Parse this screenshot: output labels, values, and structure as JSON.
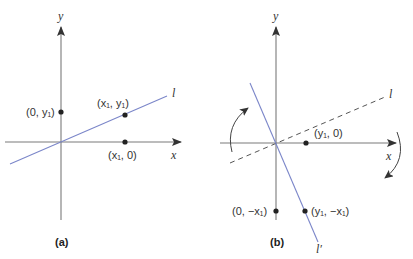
{
  "figure": {
    "panel_a": {
      "caption": "(a)",
      "axis_x_label": "x",
      "axis_y_label": "y",
      "line_label": "l",
      "points": [
        {
          "label": "(0, y₁)",
          "name": "point-0-y1"
        },
        {
          "label": "(x₁, y₁)",
          "name": "point-x1-y1"
        },
        {
          "label": "(x₁, 0)",
          "name": "point-x1-0"
        }
      ]
    },
    "panel_b": {
      "caption": "(b)",
      "axis_x_label": "x",
      "axis_y_label": "y",
      "original_line_label": "l",
      "rotated_line_label": "l′",
      "points": [
        {
          "label": "(y₁, 0)",
          "name": "point-y1-0"
        },
        {
          "label": "(0, −x₁)",
          "name": "point-0-negx1"
        },
        {
          "label": "(y₁, −x₁)",
          "name": "point-y1-negx1"
        }
      ],
      "rotation_arrows": [
        "counterclockwise-arrow-left",
        "clockwise-arrow-right"
      ]
    },
    "colors": {
      "axis": "#7a7a7a",
      "line": "#7b86c9",
      "dashed_line": "#555555",
      "point": "#222222"
    }
  }
}
